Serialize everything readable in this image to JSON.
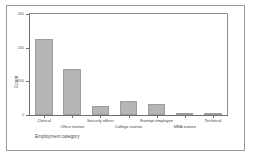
{
  "chart_data": {
    "type": "bar",
    "title": "",
    "xlabel": "Employment category",
    "ylabel": "Count",
    "categories": [
      "Clerical",
      "Office trainee",
      "Security officer",
      "College trainee",
      "Exempt employee",
      "MBA trainee",
      "Technical"
    ],
    "values": [
      227,
      136,
      27,
      41,
      32,
      5,
      3
    ],
    "ylim": [
      0,
      300
    ],
    "yticks": [
      0,
      100,
      200,
      300
    ],
    "ytick_labels": [
      "0",
      "100",
      "200",
      "300"
    ],
    "grid": false,
    "legend": false,
    "bar_color": "#b5b5b5",
    "bar_edge_color": "#9d9d9d",
    "axis_color": "#6f6f6f",
    "frame_color": "#8d8d8d",
    "background": "#ffffff"
  }
}
